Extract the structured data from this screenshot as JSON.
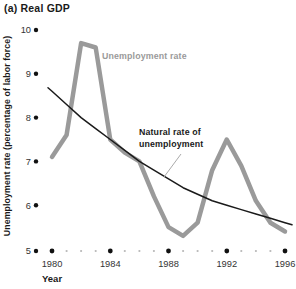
{
  "figure": {
    "title": "(a) Real GDP"
  },
  "y_axis": {
    "label": "Unemployment rate (percentage of labor force)",
    "ticks": [
      10,
      9,
      8,
      7,
      6,
      5
    ],
    "min": 5,
    "max": 10
  },
  "x_axis": {
    "label": "Year",
    "major_ticks": [
      1980,
      1984,
      1988,
      1992,
      1996
    ],
    "minor_ticks": [
      1981,
      1982,
      1983,
      1985,
      1986,
      1987,
      1989,
      1990,
      1991,
      1993,
      1994,
      1995
    ],
    "min": 1980,
    "max": 1996
  },
  "annotations": {
    "unemployment_label": "Unemployment rate",
    "natural_label": "Natural rate of unemployment"
  },
  "colors": {
    "unemployment_line": "#9a9a9a",
    "natural_line": "#1a1a1a",
    "major_dot": "#111111",
    "minor_dot": "#b8b8b8",
    "tick_text": "#333333",
    "unemployment_label": "#9a9a9a",
    "natural_label": "#1a1a1a",
    "leader_line": "#aaaaaa"
  },
  "chart_data": {
    "type": "line",
    "title": "(a) Real GDP",
    "xlabel": "Year",
    "ylabel": "Unemployment rate (percentage of labor force)",
    "xlim": [
      1980,
      1996
    ],
    "ylim": [
      5,
      10
    ],
    "grid": false,
    "legend_position": "inline-annotations",
    "x": [
      1980,
      1981,
      1982,
      1983,
      1984,
      1985,
      1986,
      1987,
      1988,
      1989,
      1990,
      1991,
      1992,
      1993,
      1994,
      1995,
      1996
    ],
    "series": [
      {
        "name": "Unemployment rate",
        "color": "#9a9a9a",
        "style": "thick",
        "values": [
          7.1,
          7.6,
          9.7,
          9.6,
          7.5,
          7.2,
          7.0,
          6.2,
          5.5,
          5.3,
          5.6,
          6.8,
          7.5,
          6.9,
          6.1,
          5.6,
          5.4
        ]
      },
      {
        "name": "Natural rate of unemployment",
        "color": "#1a1a1a",
        "style": "thin-smooth",
        "values": [
          8.6,
          8.3,
          8.0,
          7.75,
          7.5,
          7.25,
          7.0,
          6.8,
          6.6,
          6.4,
          6.25,
          6.1,
          6.0,
          5.9,
          5.8,
          5.7,
          5.6
        ]
      }
    ]
  }
}
